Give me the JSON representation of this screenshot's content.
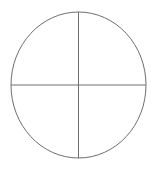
{
  "canvas": {
    "width": 157,
    "height": 170,
    "background_color": "#ffffff"
  },
  "figure": {
    "title": "",
    "stroke_color": "#6e6e6e",
    "fill_color": "none",
    "stroke_width": 1
  },
  "shapes": {
    "circle": {
      "name": "circle-outline",
      "center_x": 78.5,
      "center_y": 85,
      "radius_x": 67.5,
      "radius_y": 73
    },
    "vertical_diameter": {
      "name": "vertical-diameter-line",
      "x1": 78.5,
      "y1": 12,
      "x2": 78.5,
      "y2": 158
    },
    "horizontal_diameter": {
      "name": "horizontal-diameter-line",
      "x1": 11,
      "y1": 85,
      "x2": 146,
      "y2": 85
    }
  },
  "labels": {
    "top": "",
    "bottom": "",
    "left": "",
    "right": "",
    "center": ""
  }
}
